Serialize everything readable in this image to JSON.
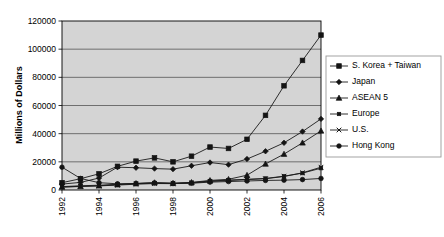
{
  "chart_data": {
    "type": "line",
    "title": "",
    "xlabel": "",
    "ylabel": "Millions of Dollars",
    "x": [
      1992,
      1993,
      1994,
      1995,
      1996,
      1997,
      1998,
      1999,
      2000,
      2001,
      2002,
      2003,
      2004,
      2005,
      2006
    ],
    "xtick_labels": [
      "1992",
      "1994",
      "1996",
      "1998",
      "2000",
      "2002",
      "2004",
      "2006"
    ],
    "xticks": [
      1992,
      1994,
      1996,
      1998,
      2000,
      2002,
      2004,
      2006
    ],
    "ytick_labels": [
      "0",
      "20000",
      "40000",
      "60000",
      "80000",
      "100000",
      "120000"
    ],
    "yticks": [
      0,
      20000,
      40000,
      60000,
      80000,
      100000,
      120000
    ],
    "ylim": [
      0,
      120000
    ],
    "xlim": [
      1992,
      2006
    ],
    "grid": "horizontal",
    "legend_position": "right",
    "plot_background": "#d4d4d4",
    "line_color": "#1a1a1a",
    "series": [
      {
        "name": "S. Korea + Taiwan",
        "marker": "square",
        "values": [
          5200,
          8000,
          11500,
          16800,
          20500,
          22800,
          20000,
          24000,
          30500,
          29500,
          36000,
          53000,
          74000,
          92000,
          110000
        ]
      },
      {
        "name": "Japan",
        "marker": "diamond",
        "values": [
          4200,
          5400,
          8500,
          16200,
          15800,
          15200,
          14800,
          17200,
          19500,
          18000,
          22000,
          27500,
          33500,
          41500,
          50500
        ]
      },
      {
        "name": "ASEAN 5",
        "marker": "triangle",
        "values": [
          2200,
          2600,
          3000,
          3800,
          4600,
          5200,
          4800,
          5400,
          6800,
          7600,
          10500,
          18500,
          25500,
          33500,
          42000
        ]
      },
      {
        "name": "Europe",
        "marker": "small-square",
        "values": [
          2400,
          3000,
          3400,
          4000,
          4600,
          5000,
          4800,
          5200,
          6400,
          7000,
          7600,
          8200,
          9800,
          12000,
          15500
        ]
      },
      {
        "name": "U.S.",
        "marker": "x",
        "values": [
          2000,
          2500,
          2900,
          3500,
          4100,
          4600,
          4500,
          5000,
          6100,
          6800,
          7400,
          8000,
          9600,
          12200,
          16200
        ]
      },
      {
        "name": "Hong Kong",
        "marker": "circle",
        "values": [
          16200,
          8200,
          5200,
          4400,
          4600,
          5000,
          4600,
          4800,
          5600,
          6000,
          6400,
          6800,
          7000,
          7400,
          8200
        ]
      }
    ]
  }
}
